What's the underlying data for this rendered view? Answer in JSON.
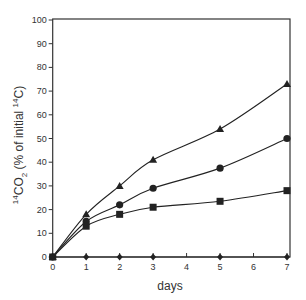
{
  "chart_data": {
    "type": "line",
    "title": "",
    "xlabel": "days",
    "ylabel": "14CO2 (% of initial 14C)",
    "ylabel_parts": {
      "sup1": "14",
      "main1": "CO",
      "sub": "2",
      "mid": " (% of initial ",
      "sup2": "14",
      "main2": "C)"
    },
    "xlim": [
      0,
      7
    ],
    "ylim": [
      0,
      100
    ],
    "x_ticks": [
      0,
      1,
      2,
      3,
      4,
      5,
      6,
      7
    ],
    "y_ticks": [
      0,
      10,
      20,
      30,
      40,
      50,
      60,
      70,
      80,
      90,
      100
    ],
    "grid": false,
    "legend": "none",
    "series": [
      {
        "name": "triangle",
        "marker": "triangle",
        "x": [
          0,
          1,
          2,
          3,
          5,
          7
        ],
        "values": [
          0,
          18,
          30,
          41,
          54,
          73
        ]
      },
      {
        "name": "circle",
        "marker": "circle",
        "x": [
          0,
          1,
          2,
          3,
          5,
          7
        ],
        "values": [
          0,
          15,
          22,
          29,
          37.5,
          50
        ]
      },
      {
        "name": "square",
        "marker": "square",
        "x": [
          0,
          1,
          2,
          3,
          5,
          7
        ],
        "values": [
          0,
          13,
          18,
          21,
          23.5,
          28
        ]
      },
      {
        "name": "diamond",
        "marker": "diamond",
        "x": [
          0,
          1,
          2,
          3,
          5,
          7
        ],
        "values": [
          0,
          0,
          0,
          0,
          0,
          0
        ]
      }
    ]
  },
  "colors": {
    "line": "#222222",
    "axis": "#333333",
    "text": "#333333"
  }
}
